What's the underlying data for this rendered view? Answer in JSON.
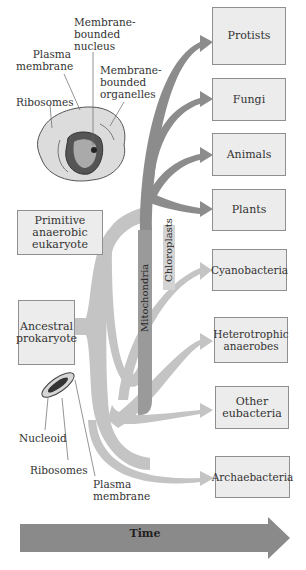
{
  "eukaryote_cell": {
    "labels": {
      "nucleus": [
        "Membrane-",
        "bounded",
        "nucleus"
      ],
      "plasma_membrane": [
        "Plasma",
        "membrane"
      ],
      "organelles": [
        "Membrane-",
        "bounded",
        "organelles"
      ],
      "ribosomes": "Ribosomes"
    }
  },
  "prokaryote_cell": {
    "labels": {
      "nucleoid": "Nucleoid",
      "ribosomes": "Ribosomes",
      "plasma_membrane": [
        "Plasma",
        "membrane"
      ]
    }
  },
  "ancestors": {
    "primitive_eukaryote": [
      "Primitive",
      "anaerobic",
      "eukaryote"
    ],
    "ancestral_prokaryote": [
      "Ancestral",
      "prokaryote"
    ]
  },
  "endosymbiont_streams": {
    "mitochondria": "Mitochondria",
    "chloroplasts": "Chloroplasts"
  },
  "groups": [
    {
      "label": [
        "Protists"
      ]
    },
    {
      "label": [
        "Fungi"
      ]
    },
    {
      "label": [
        "Animals"
      ]
    },
    {
      "label": [
        "Plants"
      ]
    },
    {
      "label": [
        "Cyanobacteria"
      ]
    },
    {
      "label": [
        "Heterotrophic",
        "anaerobes"
      ]
    },
    {
      "label": [
        "Other",
        "eubacteria"
      ]
    },
    {
      "label": [
        "Archaebacteria"
      ]
    }
  ],
  "time_arrow": {
    "label": "Time"
  },
  "colors": {
    "eukaryote_stream": "#8c8c8c",
    "mitochondria_stream": "#9a9a9a",
    "chloroplast_stream": "#d4d4d4",
    "prokaryote_stream": "#c4c4c4",
    "box_fill": "#ececec",
    "box_border": "#8f8f8f",
    "time_arrow": "#8a8a8a"
  }
}
